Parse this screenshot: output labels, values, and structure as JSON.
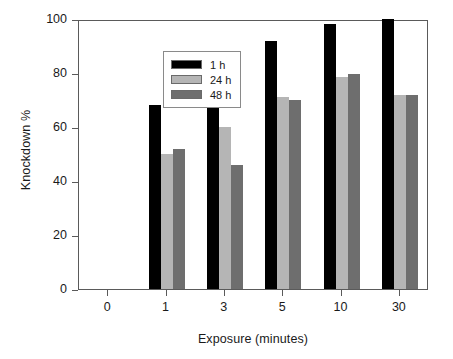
{
  "chart_data": {
    "type": "bar",
    "title": "",
    "xlabel": "Exposure (minutes)",
    "ylabel": "Knockdown %",
    "categories": [
      "0",
      "1",
      "3",
      "5",
      "10",
      "30"
    ],
    "series": [
      {
        "name": "1 h",
        "color": "#000000",
        "values": [
          0,
          68,
          68,
          92,
          98,
          100
        ]
      },
      {
        "name": "24 h",
        "color": "#b5b5b5",
        "values": [
          0,
          50,
          60,
          71,
          78.5,
          72
        ]
      },
      {
        "name": "48 h",
        "color": "#6e6e6e",
        "values": [
          0,
          52,
          46,
          70,
          79.5,
          72
        ]
      }
    ],
    "ylim": [
      0,
      100
    ],
    "yticks": [
      "0",
      "20",
      "40",
      "60",
      "80",
      "100"
    ],
    "ytick_values": [
      0,
      20,
      40,
      60,
      80,
      100
    ],
    "grid": false,
    "legend_position": "top-left",
    "legend_entries": [
      "1 h",
      "24 h",
      "48 h"
    ]
  }
}
